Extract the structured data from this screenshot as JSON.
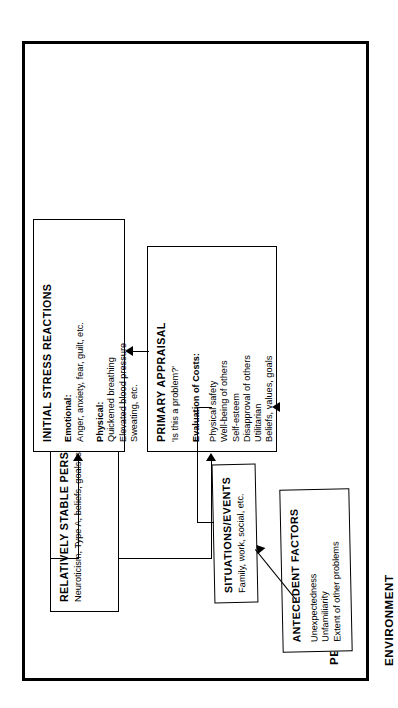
{
  "diagram": {
    "title_regions": {
      "person": "PERSON",
      "environment": "ENVIRONMENT"
    },
    "boxes": {
      "stable_personal_features": {
        "title": "RELATIVELY STABLE PERSONAL FEATURES",
        "subtitle": "Neuroticism, Type A, beliefs, goals, skills, state of health, etc."
      },
      "primary_appraisal": {
        "title": "PRIMARY APPRAISAL",
        "question": "'Is this a problem?'",
        "section_head": "Evaluation of Costs:",
        "items": [
          "Physical safety",
          "Well-being of others",
          "Self-esteem",
          "Disapproval of others",
          "Utilitarian",
          "Beliefs, values, goals"
        ]
      },
      "initial_stress_reactions": {
        "title": "INITIAL STRESS REACTIONS",
        "emotional_head": "Emotional:",
        "emotional_items": [
          "Anger, anxiety, fear, guilt, etc."
        ],
        "physical_head": "Physical:",
        "physical_items": [
          "Quickened breathing",
          "Elevated blood pressure",
          "Sweating, etc."
        ]
      },
      "situations_events": {
        "title": "SITUATIONS/EVENTS",
        "subtitle": "Family, work, social, etc."
      },
      "antecedent_factors": {
        "title": "ANTECEDENT FACTORS",
        "items": [
          "Unexpectedness",
          "Unfamiliarity",
          "Extent of other problems"
        ]
      }
    },
    "colors": {
      "ink": "#000000",
      "paper": "#ffffff"
    }
  }
}
